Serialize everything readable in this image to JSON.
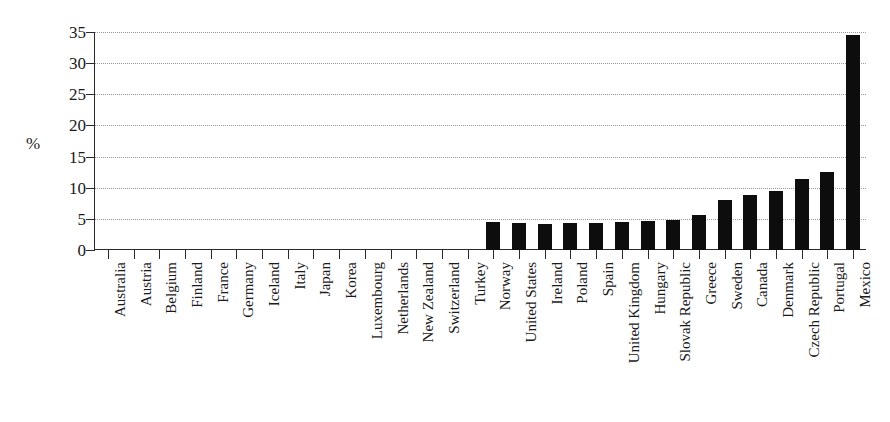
{
  "chart_data": {
    "type": "bar",
    "title": "",
    "subtitle": "",
    "xlabel": "",
    "ylabel": "%",
    "ylim": [
      0,
      35
    ],
    "ytick_values": [
      0,
      5,
      10,
      15,
      20,
      25,
      30,
      35
    ],
    "ytick_labels": [
      "0",
      "5",
      "10",
      "15",
      "20",
      "25",
      "30",
      "35"
    ],
    "grid": true,
    "grid_style": "dotted-horizontal",
    "legend": null,
    "legend_position": "none",
    "bar_color": "#0d0d0d",
    "axis_color": "#2a2a2a",
    "gridline_color": "#9a9a9a",
    "categories": [
      "Australia",
      "Austria",
      "Belgium",
      "Finland",
      "France",
      "Germany",
      "Iceland",
      "Italy",
      "Japan",
      "Korea",
      "Luxembourg",
      "Netherlands",
      "New Zealand",
      "Switzerland",
      "Turkey",
      "Norway",
      "United States",
      "Ireland",
      "Poland",
      "Spain",
      "United Kingdom",
      "Hungary",
      "Slovak Republic",
      "Greece",
      "Sweden",
      "Canada",
      "Denmark",
      "Czech Republic",
      "Portugal",
      "Mexico"
    ],
    "values": [
      0,
      0,
      0,
      0,
      0,
      0,
      0,
      0,
      0,
      0,
      0,
      0,
      0,
      0,
      0,
      4.5,
      4.3,
      4.2,
      4.3,
      4.4,
      4.5,
      4.7,
      4.8,
      5.6,
      8.1,
      8.9,
      9.5,
      11.4,
      12.5,
      34.5
    ]
  }
}
